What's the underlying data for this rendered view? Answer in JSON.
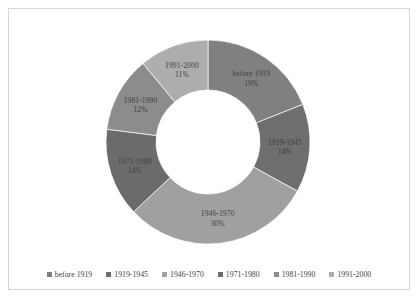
{
  "chart_data": {
    "type": "pie",
    "variant": "doughnut",
    "title": "",
    "subtitle": "",
    "xlabel": "",
    "ylabel": "",
    "grid": false,
    "legend_position": "bottom",
    "hole_ratio": 0.51,
    "start_angle_deg": 0,
    "direction": "clockwise",
    "units": "percent",
    "total": 100,
    "categories": [
      "before 1919",
      "1919-1945",
      "1946-1970",
      "1971-1980",
      "1981-1990",
      "1991-2000"
    ],
    "values": [
      19,
      14,
      30,
      14,
      12,
      11
    ],
    "data_labels": [
      "before 1919\n19%",
      "1919-1945\n14%",
      "1946-1970\n30%",
      "1971-1980\n14%",
      "1981-1990\n12%",
      "1991-2000\n11%"
    ],
    "colors": [
      "#808080",
      "#6e6e6e",
      "#a0a0a0",
      "#6b6b6b",
      "#8c8c8c",
      "#adadad"
    ],
    "slices": [
      {
        "label": "before 1919",
        "value": 19,
        "percent_text": "19%",
        "color": "#808080"
      },
      {
        "label": "1919-1945",
        "value": 14,
        "percent_text": "14%",
        "color": "#6e6e6e"
      },
      {
        "label": "1946-1970",
        "value": 30,
        "percent_text": "30%",
        "color": "#a0a0a0"
      },
      {
        "label": "1971-1980",
        "value": 14,
        "percent_text": "14%",
        "color": "#6b6b6b"
      },
      {
        "label": "1981-1990",
        "value": 12,
        "percent_text": "12%",
        "color": "#8c8c8c"
      },
      {
        "label": "1991-2000",
        "value": 11,
        "percent_text": "11%",
        "color": "#adadad"
      }
    ]
  },
  "legend": {
    "items": [
      {
        "label": "before 1919",
        "color": "#808080"
      },
      {
        "label": "1919-1945",
        "color": "#6e6e6e"
      },
      {
        "label": "1946-1970",
        "color": "#a0a0a0"
      },
      {
        "label": "1971-1980",
        "color": "#6b6b6b"
      },
      {
        "label": "1981-1990",
        "color": "#8c8c8c"
      },
      {
        "label": "1991-2000",
        "color": "#adadad"
      }
    ]
  },
  "style": {
    "background": "#ffffff",
    "frame_border": "#d4d4d4",
    "label_text": "#404040"
  }
}
